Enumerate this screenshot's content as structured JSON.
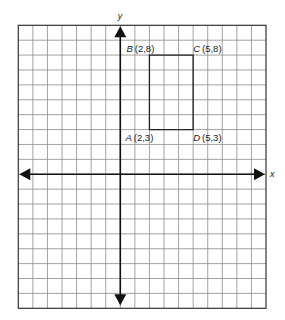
{
  "figure": {
    "type": "coordinate-grid",
    "axes": {
      "x_label": "x",
      "y_label": "y",
      "x_range": [
        -7,
        10
      ],
      "y_range": [
        -9,
        10
      ],
      "grid_step": 1,
      "arrows": true
    },
    "colors": {
      "grid": "#8c8c8c",
      "axis": "#111111",
      "shape": "#222222",
      "background": "#ffffff"
    },
    "rectangle": {
      "name": "ABCD",
      "vertices": [
        {
          "letter": "A",
          "coords": "(2,3)",
          "x": 2,
          "y": 3,
          "anchor": "bottom-left"
        },
        {
          "letter": "B",
          "coords": "(2,8)",
          "x": 2,
          "y": 8,
          "anchor": "top-left"
        },
        {
          "letter": "C",
          "coords": "(5,8)",
          "x": 5,
          "y": 8,
          "anchor": "top-right"
        },
        {
          "letter": "D",
          "coords": "(5,3)",
          "x": 5,
          "y": 3,
          "anchor": "bottom-right"
        }
      ]
    }
  }
}
